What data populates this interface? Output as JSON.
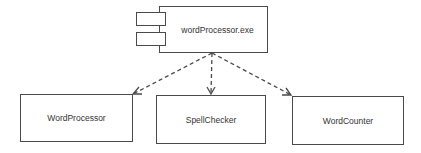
{
  "diagram": {
    "type": "UML component/deployment diagram",
    "artifact": {
      "label": "wordProcessor.exe",
      "shape": "component"
    },
    "components": [
      {
        "label": "WordProcessor"
      },
      {
        "label": "SpellChecker"
      },
      {
        "label": "WordCounter"
      }
    ],
    "edges": [
      {
        "from": "wordProcessor.exe",
        "to": "WordProcessor",
        "style": "dashed",
        "arrow": "open"
      },
      {
        "from": "wordProcessor.exe",
        "to": "SpellChecker",
        "style": "dashed",
        "arrow": "open"
      },
      {
        "from": "wordProcessor.exe",
        "to": "WordCounter",
        "style": "dashed",
        "arrow": "open"
      }
    ],
    "colors": {
      "line": "#4a4a4a",
      "text": "#333333",
      "background": "#ffffff"
    }
  }
}
